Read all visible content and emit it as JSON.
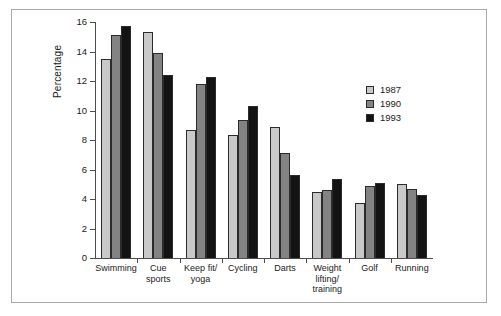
{
  "chart_data": {
    "type": "bar",
    "title": "",
    "xlabel": "",
    "ylabel": "Percentage",
    "ylim": [
      0,
      16
    ],
    "yticks": [
      0,
      2,
      4,
      6,
      8,
      10,
      12,
      14,
      16
    ],
    "grid": false,
    "legend_position": "right",
    "categories": [
      "Swimming",
      "Cue\nsports",
      "Keep fit/\nyoga",
      "Cycling",
      "Darts",
      "Weight\nlifting/\ntraining",
      "Golf",
      "Running"
    ],
    "series": [
      {
        "name": "1987",
        "color": "#c9c9c9",
        "values": [
          13.5,
          15.3,
          8.7,
          8.35,
          8.9,
          4.45,
          3.75,
          5.05
        ]
      },
      {
        "name": "1990",
        "color": "#838383",
        "values": [
          15.1,
          13.9,
          11.8,
          9.35,
          7.1,
          4.6,
          4.85,
          4.7
        ]
      },
      {
        "name": "1993",
        "color": "#131313",
        "values": [
          15.7,
          12.4,
          12.3,
          10.3,
          5.6,
          5.35,
          5.1,
          4.3
        ]
      }
    ]
  }
}
